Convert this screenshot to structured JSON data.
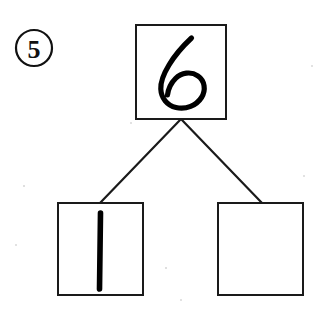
{
  "worksheet": {
    "background_color": "#ffffff",
    "ink_color": "#000000",
    "line_color": "#1a1a1a",
    "question_number": "5",
    "question_number_style": "circled",
    "type": "number-bond",
    "whole_box": {
      "label": "whole",
      "value": "6",
      "filled": true,
      "handwritten": true
    },
    "part_box_left": {
      "label": "part",
      "value": "1",
      "filled": true,
      "handwritten": true
    },
    "part_box_right": {
      "label": "part",
      "value": "",
      "filled": false,
      "handwritten": false
    },
    "connectors": [
      {
        "from": "whole-box",
        "to": "part-box-left"
      },
      {
        "from": "whole-box",
        "to": "part-box-right"
      }
    ]
  }
}
